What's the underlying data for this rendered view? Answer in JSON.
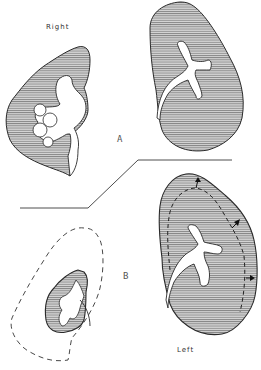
{
  "figure": {
    "labels": {
      "right": "Right",
      "left": "Left",
      "panel_a": "A",
      "panel_b": "B"
    },
    "colors": {
      "outline": "#2a2a2a",
      "hatch": "#555555",
      "fill": "#c9c9c9",
      "background": "#ffffff"
    },
    "panels": [
      {
        "id": "A",
        "description": "Kidney outlines before: right kidney with irregular pelvis, left kidney with branching collecting system"
      },
      {
        "id": "B",
        "description": "Kidney outlines after: small contracted right kidney within dashed original outline, enlarged left kidney with dashed prior outline and arrows indicating growth"
      }
    ]
  }
}
